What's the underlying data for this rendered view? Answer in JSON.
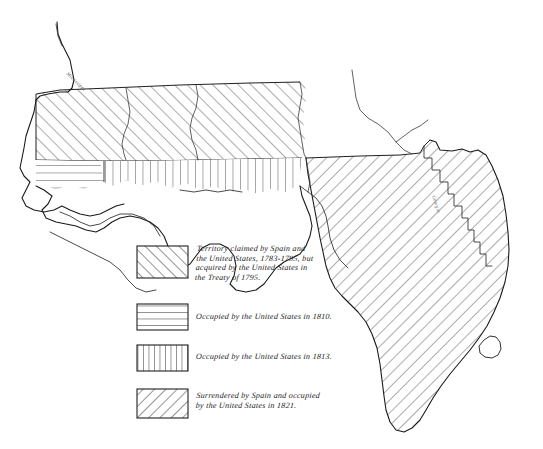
{
  "document": {
    "title": "West Florida and Florida Territorial Acquisitions Map",
    "medium": "hand-drawn pen and ink historical map"
  },
  "legend": {
    "name": "map-legend",
    "entries": [
      {
        "id": "legend-entry-1795",
        "pattern": "diagonal-hatch-up",
        "swatch_name": "legend-swatch-treaty-1795",
        "text": "Territory claimed by Spain and\nthe United States, 1783-1795, but\nacquired by the United States in\nthe Treaty of 1795."
      },
      {
        "id": "legend-entry-1810",
        "pattern": "horizontal-hatch",
        "swatch_name": "legend-swatch-occupied-1810",
        "text": "Occupied by the United States in 1810."
      },
      {
        "id": "legend-entry-1813",
        "pattern": "vertical-hatch",
        "swatch_name": "legend-swatch-occupied-1813",
        "text": "Occupied by the United States in 1813."
      },
      {
        "id": "legend-entry-1821",
        "pattern": "diagonal-hatch-down",
        "swatch_name": "legend-swatch-surrendered-1821",
        "text": "Surrendered by Spain and occupied\nby the United States in 1821."
      }
    ]
  },
  "map": {
    "regions": [
      {
        "name": "region-treaty-1795",
        "label": "Territory claimed by Spain and the United States, 1783-1795",
        "pattern": "diagonal-hatch-up"
      },
      {
        "name": "region-occupied-1810",
        "label": "Occupied by the United States in 1810",
        "pattern": "horizontal-hatch"
      },
      {
        "name": "region-occupied-1813",
        "label": "Occupied by the United States in 1813",
        "pattern": "vertical-hatch"
      },
      {
        "name": "region-surrendered-1821",
        "label": "Surrendered by Spain and occupied by the United States in 1821",
        "pattern": "diagonal-hatch-down"
      }
    ],
    "features": [
      {
        "name": "lake-okeechobee",
        "type": "lake"
      },
      {
        "name": "mississippi-river",
        "type": "river"
      },
      {
        "name": "river-label-northwest",
        "type": "river-label",
        "text": "Mississippi"
      },
      {
        "name": "border-label-florida-east",
        "type": "border-label",
        "text": "Georgia"
      }
    ]
  },
  "colors": {
    "background": "#ffffff",
    "ink": "#1a1a1a",
    "hatch": "#333333",
    "faint_ink": "#555555"
  }
}
